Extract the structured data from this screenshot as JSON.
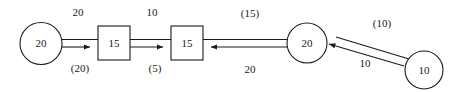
{
  "diagram": {
    "type": "network-flow-diagram",
    "nodes": [
      {
        "id": "n1",
        "shape": "circle",
        "label": "20"
      },
      {
        "id": "n2",
        "shape": "box",
        "label": "15"
      },
      {
        "id": "n3",
        "shape": "box",
        "label": "15"
      },
      {
        "id": "n4",
        "shape": "circle",
        "label": "20"
      },
      {
        "id": "n5",
        "shape": "circle",
        "label": "10"
      }
    ],
    "edges": [
      {
        "id": "e1",
        "from": "n1",
        "to": "n2",
        "above_label": "20",
        "below_label": "(20)"
      },
      {
        "id": "e2",
        "from": "n2",
        "to": "n3",
        "above_label": "10",
        "below_label": "(5)"
      },
      {
        "id": "e3",
        "from": "n4",
        "to": "n3",
        "above_label": "(15)",
        "below_label": "20"
      },
      {
        "id": "e4",
        "from": "n5",
        "to": "n4",
        "above_label": "(10)",
        "below_label": "10"
      }
    ],
    "colors": {
      "stroke": "#1a1a1a",
      "fill": "#ffffff",
      "background": "#ffffff"
    }
  }
}
